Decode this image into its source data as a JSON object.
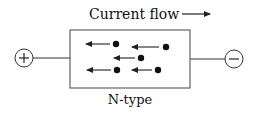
{
  "diagram": {
    "title": "Current flow",
    "material_label": "N-type",
    "positive_terminal": "+",
    "negative_terminal": "−",
    "title_arrow_direction": "right",
    "carrier_arrow_direction": "left",
    "colors": {
      "stroke": "#222222",
      "background": "#ffffff"
    },
    "carriers": [
      {
        "name": "electron-1",
        "cx": 116,
        "cy": 44
      },
      {
        "name": "electron-2",
        "cx": 166,
        "cy": 47
      },
      {
        "name": "electron-3",
        "cx": 141,
        "cy": 58
      },
      {
        "name": "electron-4",
        "cx": 117,
        "cy": 70
      },
      {
        "name": "electron-5",
        "cx": 158,
        "cy": 70
      }
    ]
  }
}
